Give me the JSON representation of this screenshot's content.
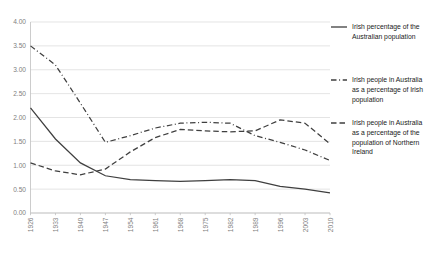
{
  "chart_data": {
    "type": "line",
    "title": "",
    "xlabel": "",
    "ylabel": "",
    "ylim": [
      0,
      4
    ],
    "ytick_labels": [
      "0.00",
      "0.50",
      "1.00",
      "1.50",
      "2.00",
      "2.50",
      "3.00",
      "3.50",
      "4.00"
    ],
    "ytick_values": [
      0,
      0.5,
      1,
      1.5,
      2,
      2.5,
      3,
      3.5,
      4
    ],
    "grid": true,
    "legend_position": "right",
    "categories": [
      1926,
      1933,
      1940,
      1947,
      1954,
      1961,
      1968,
      1975,
      1982,
      1989,
      1996,
      2003,
      2010
    ],
    "xtick_labels": [
      "1926",
      "1933",
      "1940",
      "1947",
      "1954",
      "1961",
      "1968",
      "1975",
      "1982",
      "1989",
      "1996",
      "2003",
      "2010"
    ],
    "series": [
      {
        "name": "Irish percentage of the Australian population",
        "dash": "solid",
        "values": [
          2.2,
          1.55,
          1.05,
          0.78,
          0.7,
          0.68,
          0.66,
          0.68,
          0.7,
          0.68,
          0.56,
          0.5,
          0.42
        ]
      },
      {
        "name": "Irish people in Australia as a percentage of Irish population",
        "dash": "dashdot",
        "values": [
          3.5,
          3.1,
          2.3,
          1.48,
          1.62,
          1.78,
          1.88,
          1.9,
          1.88,
          1.62,
          1.48,
          1.32,
          1.1
        ]
      },
      {
        "name": "Irish people in Australia as a percentage of the population of Northern Ireland",
        "dash": "dashed",
        "values": [
          1.05,
          0.88,
          0.8,
          0.92,
          1.28,
          1.58,
          1.75,
          1.72,
          1.7,
          1.72,
          1.95,
          1.88,
          1.45
        ]
      }
    ]
  },
  "legend": {
    "entries": [
      {
        "label": "Irish percentage of the Australian population",
        "style": "solid"
      },
      {
        "label": "Irish people in Australia as a percentage of Irish population",
        "style": "dashdot"
      },
      {
        "label": "Irish people in Australia as a percentage of the population of Northern Ireland",
        "style": "dashed"
      }
    ]
  },
  "colors": {
    "series": "#3f3f3f",
    "grid": "#d9d9d9",
    "axis": "#bfbfbf",
    "tick_text": "#808080",
    "legend_text": "#1a1a1a",
    "background": "#ffffff"
  }
}
